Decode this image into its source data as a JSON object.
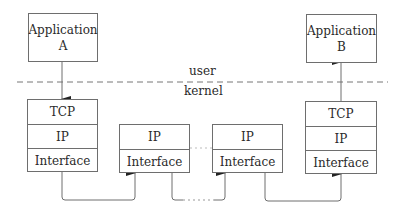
{
  "diagram": {
    "boundary": {
      "upper_label": "user",
      "lower_label": "kernel"
    },
    "host_a": {
      "application": {
        "line1": "Application",
        "line2": "A"
      },
      "stack": [
        "TCP",
        "IP",
        "Interface"
      ]
    },
    "router_1": {
      "stack": [
        "IP",
        "Interface"
      ]
    },
    "router_2": {
      "stack": [
        "IP",
        "Interface"
      ]
    },
    "host_b": {
      "application": {
        "line1": "Application",
        "line2": "B"
      },
      "stack": [
        "TCP",
        "IP",
        "Interface"
      ]
    },
    "colors": {
      "line": "#6e6e6e",
      "text": "#2a2a2a",
      "background": "#ffffff"
    }
  }
}
